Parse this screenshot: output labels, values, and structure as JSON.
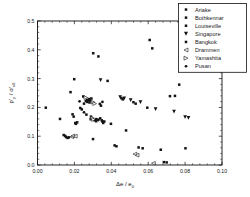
{
  "chart_data": {
    "type": "scatter",
    "title": "",
    "xlabel": "Δe / e0",
    "xlabel_main": "Δe / e",
    "xlabel_sub": "0",
    "ylabel": "p'y / σ'v0",
    "ylabel_parts": {
      "p1": "p'",
      "p1_sub": "y",
      "slash": " / ",
      "p2": "σ'",
      "p2_sub": "v0"
    },
    "xlim": [
      0.0,
      0.1
    ],
    "ylim": [
      0.0,
      0.5
    ],
    "xticks": [
      0.0,
      0.02,
      0.04,
      0.06,
      0.08,
      0.1
    ],
    "xtick_labels": [
      "0.00",
      "0.02",
      "0.04",
      "0.06",
      "0.08",
      "0.10"
    ],
    "yticks": [
      0.0,
      0.1,
      0.2,
      0.3,
      0.4,
      0.5
    ],
    "ytick_labels": [
      "0.0",
      "0.1",
      "0.2",
      "0.3",
      "0.4",
      "0.5"
    ],
    "x_minor_count": 4,
    "y_minor_count": 4,
    "grid": false,
    "legend_position": "top-right",
    "series": [
      {
        "name": "Ariake",
        "marker": "square",
        "filled": true,
        "points": [
          [
            0.0045,
            0.199
          ],
          [
            0.0122,
            0.16
          ],
          [
            0.0142,
            0.104
          ],
          [
            0.015,
            0.101
          ],
          [
            0.0155,
            0.097
          ],
          [
            0.0163,
            0.094
          ],
          [
            0.017,
            0.096
          ],
          [
            0.0179,
            0.253
          ],
          [
            0.019,
            0.176
          ],
          [
            0.0196,
            0.168
          ],
          [
            0.0199,
            0.298
          ],
          [
            0.0205,
            0.146
          ],
          [
            0.0208,
            0.143
          ],
          [
            0.0215,
            0.148
          ],
          [
            0.0248,
            0.238
          ],
          [
            0.0252,
            0.213
          ],
          [
            0.0262,
            0.222
          ],
          [
            0.0268,
            0.226
          ],
          [
            0.028,
            0.229
          ],
          [
            0.0285,
            0.224
          ],
          [
            0.0292,
            0.231
          ],
          [
            0.0302,
            0.388
          ],
          [
            0.031,
            0.155
          ],
          [
            0.0318,
            0.152
          ],
          [
            0.0325,
            0.158
          ],
          [
            0.033,
            0.377
          ],
          [
            0.034,
            0.162
          ],
          [
            0.0348,
            0.155
          ],
          [
            0.0352,
            0.151
          ],
          [
            0.0301,
            0.09
          ],
          [
            0.038,
            0.292
          ],
          [
            0.0398,
            0.143
          ],
          [
            0.0418,
            0.068
          ],
          [
            0.0428,
            0.065
          ],
          [
            0.0455,
            0.232
          ],
          [
            0.0462,
            0.228
          ],
          [
            0.048,
            0.12
          ],
          [
            0.052,
            0.218
          ],
          [
            0.0532,
            0.213
          ],
          [
            0.0548,
            0.061
          ],
          [
            0.057,
            0.058
          ],
          [
            0.0595,
            0.199
          ],
          [
            0.0608,
            0.434
          ],
          [
            0.0622,
            0.405
          ],
          [
            0.0668,
            0.053
          ],
          [
            0.0685,
            0.01
          ],
          [
            0.07,
            0.009
          ],
          [
            0.0718,
            0.239
          ],
          [
            0.0745,
            0.24
          ],
          [
            0.0768,
            0.279
          ],
          [
            0.0802,
            0.058
          ]
        ]
      },
      {
        "name": "Bothkennar",
        "marker": "square",
        "filled": true,
        "points": [
          [
            0.027,
            0.219
          ],
          [
            0.0275,
            0.225
          ],
          [
            0.0282,
            0.217
          ],
          [
            0.0288,
            0.159
          ],
          [
            0.0292,
            0.163
          ]
        ]
      },
      {
        "name": "Louiseville",
        "marker": "square",
        "filled": true,
        "points": [
          [
            0.0338,
            0.212
          ],
          [
            0.0344,
            0.206
          ],
          [
            0.0356,
            0.146
          ],
          [
            0.0362,
            0.151
          ]
        ]
      },
      {
        "name": "Singapore",
        "marker": "triangle-down",
        "filled": true,
        "points": [
          [
            0.0342,
            0.295
          ],
          [
            0.0448,
            0.236
          ],
          [
            0.047,
            0.231
          ],
          [
            0.0505,
            0.225
          ],
          [
            0.0558,
            0.218
          ],
          [
            0.064,
            0.194
          ],
          [
            0.074,
            0.185
          ],
          [
            0.08,
            0.166
          ],
          [
            0.0818,
            0.164
          ]
        ]
      },
      {
        "name": "Bangkok",
        "marker": "square",
        "filled": true,
        "points": [
          [
            0.0232,
            0.198
          ],
          [
            0.024,
            0.193
          ],
          [
            0.0265,
            0.175
          ],
          [
            0.029,
            0.168
          ]
        ]
      },
      {
        "name": "Drammen",
        "marker": "triangle-left",
        "filled": false,
        "points": [
          [
            0.0185,
            0.098
          ],
          [
            0.0192,
            0.101
          ],
          [
            0.0205,
            0.1
          ],
          [
            0.0528,
            0.038
          ],
          [
            0.054,
            0.034
          ],
          [
            0.0628,
            0.006
          ]
        ]
      },
      {
        "name": "Yamashita",
        "marker": "triangle-right",
        "filled": false,
        "points": [
          [
            0.0262,
            0.234
          ],
          [
            0.0302,
            0.218
          ],
          [
            0.031,
            0.213
          ],
          [
            0.0298,
            0.163
          ],
          [
            0.0304,
            0.158
          ]
        ]
      },
      {
        "name": "Pusan",
        "marker": "circle",
        "filled": true,
        "points": [
          [
            0.0228,
            0.221
          ],
          [
            0.0318,
            0.159
          ],
          [
            0.033,
            0.156
          ],
          [
            0.0352,
            0.219
          ],
          [
            0.0252,
            0.183
          ]
        ]
      }
    ]
  },
  "legend": {
    "entries": [
      {
        "label": "Ariake",
        "marker": "square",
        "filled": true
      },
      {
        "label": "Bothkennar",
        "marker": "square",
        "filled": true
      },
      {
        "label": "Louiseville",
        "marker": "square",
        "filled": true
      },
      {
        "label": "Singapore",
        "marker": "triangle-down",
        "filled": true
      },
      {
        "label": "Bangkok",
        "marker": "square",
        "filled": true
      },
      {
        "label": "Drammen",
        "marker": "triangle-left",
        "filled": false
      },
      {
        "label": "Yamashita",
        "marker": "triangle-right",
        "filled": false
      },
      {
        "label": "Pusan",
        "marker": "circle",
        "filled": true
      }
    ]
  },
  "colors": {
    "foreground": "#131313",
    "background": "#ffffff",
    "axis": "#111111"
  }
}
